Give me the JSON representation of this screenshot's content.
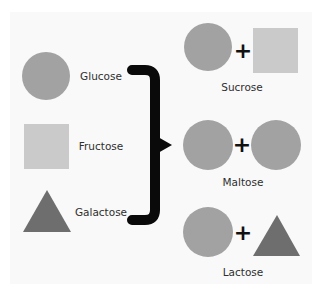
{
  "colors": {
    "background": "#ffffff",
    "panel": "#f9f9f9",
    "glucose": "#a2a2a2",
    "fructose": "#cacaca",
    "galactose": "#6e6e6e",
    "bracket": "#0a0a0a",
    "text": "#2f2f2f"
  },
  "monosaccharides": [
    {
      "name": "Glucose",
      "shape": "circle"
    },
    {
      "name": "Fructose",
      "shape": "square"
    },
    {
      "name": "Galactose",
      "shape": "triangle"
    }
  ],
  "connector": {
    "type": "right-curly-bracket-with-pointer"
  },
  "disaccharides": [
    {
      "name": "Sucrose",
      "operator": "+",
      "components": [
        "Glucose",
        "Fructose"
      ]
    },
    {
      "name": "Maltose",
      "operator": "+",
      "components": [
        "Glucose",
        "Glucose"
      ]
    },
    {
      "name": "Lactose",
      "operator": "+",
      "components": [
        "Glucose",
        "Galactose"
      ]
    }
  ]
}
